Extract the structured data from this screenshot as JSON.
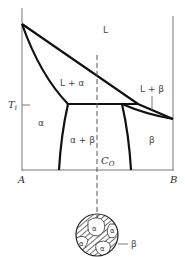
{
  "diagram": {
    "type": "binary eutectic phase diagram",
    "regions": {
      "liquid": "L",
      "l_alpha": "L + α",
      "l_beta": "L + β",
      "alpha": "α",
      "alpha_beta": "α + β",
      "beta": "β"
    },
    "axis": {
      "left_component": "A",
      "right_component": "B",
      "temperature_label": "T",
      "temperature_subscript": "i",
      "composition_label": "C",
      "composition_subscript": "O"
    },
    "microstructure": {
      "grain_label": "α",
      "matrix_label": "β"
    }
  }
}
